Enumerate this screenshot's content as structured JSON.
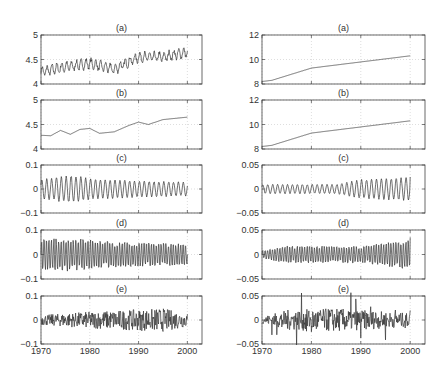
{
  "figure": {
    "columns": [
      {
        "name": "left",
        "panels": [
          {
            "label": "(a)",
            "ylim": [
              4,
              5
            ],
            "yticks": [
              "4",
              "4.5",
              "5"
            ],
            "yticks_v": [
              4,
              4.5,
              5
            ]
          },
          {
            "label": "(b)",
            "ylim": [
              4,
              5
            ],
            "yticks": [
              "4",
              "4.5",
              "5"
            ],
            "yticks_v": [
              4,
              4.5,
              5
            ]
          },
          {
            "label": "(c)",
            "ylim": [
              -0.1,
              0.1
            ],
            "yticks": [
              "−0.1",
              "0",
              "0.1"
            ],
            "yticks_v": [
              -0.1,
              0,
              0.1
            ]
          },
          {
            "label": "(d)",
            "ylim": [
              -0.1,
              0.1
            ],
            "yticks": [
              "−0.1",
              "0",
              "0.1"
            ],
            "yticks_v": [
              -0.1,
              0,
              0.1
            ]
          },
          {
            "label": "(e)",
            "ylim": [
              -0.1,
              0.1
            ],
            "yticks": [
              "−0.1",
              "0",
              "0.1"
            ],
            "yticks_v": [
              -0.1,
              0,
              0.1
            ]
          }
        ]
      },
      {
        "name": "right",
        "panels": [
          {
            "label": "(a)",
            "ylim": [
              8,
              12
            ],
            "yticks": [
              "8",
              "10",
              "12"
            ],
            "yticks_v": [
              8,
              10,
              12
            ]
          },
          {
            "label": "(b)",
            "ylim": [
              8,
              12
            ],
            "yticks": [
              "8",
              "10",
              "12"
            ],
            "yticks_v": [
              8,
              10,
              12
            ]
          },
          {
            "label": "(c)",
            "ylim": [
              -0.05,
              0.05
            ],
            "yticks": [
              "−0.05",
              "0",
              "0.05"
            ],
            "yticks_v": [
              -0.05,
              0,
              0.05
            ]
          },
          {
            "label": "(d)",
            "ylim": [
              -0.05,
              0.05
            ],
            "yticks": [
              "−0.05",
              "0",
              "0.05"
            ],
            "yticks_v": [
              -0.05,
              0,
              0.05
            ]
          },
          {
            "label": "(e)",
            "ylim": [
              -0.05,
              0.05
            ],
            "yticks": [
              "−0.05",
              "0",
              "0.05"
            ],
            "yticks_v": [
              -0.05,
              0,
              0.05
            ]
          }
        ]
      }
    ],
    "xticks": [
      "1970",
      "1980",
      "1990",
      "2000"
    ],
    "xticks_v": [
      1970,
      1980,
      1990,
      2000
    ],
    "xlim": [
      1970,
      2003
    ],
    "line_color": "#333333",
    "grid_color": "#c8c8c8"
  },
  "chart_data": [
    {
      "type": "line",
      "title": "(a)",
      "column": "left",
      "xlabel": "",
      "ylabel": "",
      "xlim": [
        1970,
        2003
      ],
      "ylim": [
        4,
        5
      ],
      "grid": true,
      "description": "Monthly series with seasonal oscillation around upward trend",
      "x": [
        1970,
        1975,
        1980,
        1985,
        1990,
        1995,
        2000
      ],
      "values": [
        4.25,
        4.35,
        4.42,
        4.3,
        4.55,
        4.55,
        4.65
      ]
    },
    {
      "type": "line",
      "title": "(b)",
      "column": "left",
      "xlim": [
        1970,
        2003
      ],
      "ylim": [
        4,
        5
      ],
      "grid": true,
      "description": "Smoothed trend component",
      "x": [
        1970,
        1972,
        1974,
        1976,
        1978,
        1980,
        1982,
        1985,
        1988,
        1990,
        1992,
        1995,
        1998,
        2000
      ],
      "values": [
        4.28,
        4.27,
        4.38,
        4.3,
        4.4,
        4.42,
        4.32,
        4.35,
        4.48,
        4.55,
        4.5,
        4.6,
        4.63,
        4.65
      ]
    },
    {
      "type": "line",
      "title": "(c)",
      "column": "left",
      "xlim": [
        1970,
        2003
      ],
      "ylim": [
        -0.1,
        0.1
      ],
      "grid": true,
      "description": "Annual cycle component, amplitude ~0.04-0.06, peak around 1976",
      "x": [
        1970,
        1976,
        1980,
        1990,
        2000
      ],
      "values": [
        0.04,
        0.06,
        0.045,
        0.035,
        0.03
      ]
    },
    {
      "type": "line",
      "title": "(d)",
      "column": "left",
      "xlim": [
        1970,
        2003
      ],
      "ylim": [
        -0.1,
        0.1
      ],
      "grid": true,
      "description": "Higher-frequency seasonal component, amplitude ~0.07-0.08 decaying to ~0.05",
      "x": [
        1970,
        1975,
        1985,
        2000
      ],
      "values": [
        0.07,
        0.08,
        0.06,
        0.05
      ]
    },
    {
      "type": "line",
      "title": "(e)",
      "column": "left",
      "xlim": [
        1970,
        2003
      ],
      "ylim": [
        -0.1,
        0.1
      ],
      "grid": true,
      "description": "Irregular residual, amplitude ~0.03-0.07",
      "x": [
        1970,
        1980,
        1995,
        2000
      ],
      "values": [
        0.03,
        0.05,
        0.07,
        0.04
      ]
    },
    {
      "type": "line",
      "title": "(a)",
      "column": "right",
      "xlim": [
        1970,
        2003
      ],
      "ylim": [
        8,
        12
      ],
      "grid": true,
      "x": [
        1970,
        1972,
        1980,
        1990,
        2000
      ],
      "values": [
        8.2,
        8.3,
        9.3,
        9.8,
        10.3
      ]
    },
    {
      "type": "line",
      "title": "(b)",
      "column": "right",
      "xlim": [
        1970,
        2003
      ],
      "ylim": [
        8,
        12
      ],
      "grid": true,
      "x": [
        1970,
        1972,
        1980,
        1990,
        2000
      ],
      "values": [
        8.2,
        8.3,
        9.3,
        9.8,
        10.3
      ]
    },
    {
      "type": "line",
      "title": "(c)",
      "column": "right",
      "xlim": [
        1970,
        2003
      ],
      "ylim": [
        -0.05,
        0.05
      ],
      "grid": true,
      "description": "Seasonal component, amplitude ~0.01-0.02, spike to 0.025 at end",
      "x": [
        1970,
        1985,
        1990,
        2000
      ],
      "values": [
        0.01,
        0.01,
        0.02,
        0.025
      ]
    },
    {
      "type": "line",
      "title": "(d)",
      "column": "right",
      "xlim": [
        1970,
        2003
      ],
      "ylim": [
        -0.05,
        0.05
      ],
      "grid": true,
      "description": "Spiky seasonal component, amplitude ~0.02, spike ~0.035 at 2000",
      "x": [
        1970,
        1975,
        1990,
        2000
      ],
      "values": [
        0.01,
        0.02,
        0.02,
        0.035
      ]
    },
    {
      "type": "line",
      "title": "(e)",
      "column": "right",
      "xlim": [
        1970,
        2003
      ],
      "ylim": [
        -0.05,
        0.05
      ],
      "grid": true,
      "description": "Residual with periodic spikes, amplitude ~0.03",
      "x": [
        1970,
        1975,
        1985,
        2000
      ],
      "values": [
        0.01,
        0.03,
        0.035,
        0.02
      ]
    }
  ]
}
